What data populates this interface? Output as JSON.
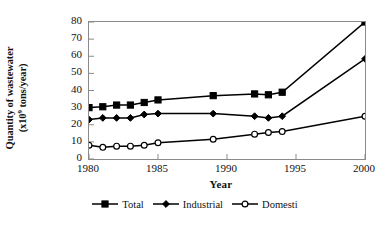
{
  "chart_data": {
    "type": "line",
    "title": "",
    "xlabel": "Year",
    "ylabel_line1": "Quantity of wastewater",
    "ylabel_line2_pre": "(x10",
    "ylabel_line2_sup": "9",
    "ylabel_line2_post": " tons/year)",
    "xlim": [
      1980,
      2000
    ],
    "ylim": [
      0,
      80
    ],
    "xticks": [
      1980,
      1985,
      1990,
      1995,
      2000
    ],
    "yticks": [
      0,
      10,
      20,
      30,
      40,
      50,
      60,
      70,
      80
    ],
    "grid": false,
    "legend_position": "bottom",
    "x": [
      1980,
      1981,
      1982,
      1983,
      1984,
      1985,
      1989,
      1992,
      1993,
      1994,
      2000
    ],
    "series": [
      {
        "name": "Total",
        "marker": "filled-square",
        "color": "#000000",
        "values": [
          30,
          30.5,
          31.5,
          31.5,
          33,
          34.5,
          37,
          38,
          37.5,
          39,
          80
        ]
      },
      {
        "name": "Industrial",
        "marker": "filled-diamond",
        "color": "#000000",
        "values": [
          23,
          24,
          24,
          24,
          26,
          26.5,
          26.5,
          25,
          24,
          25,
          58.5
        ]
      },
      {
        "name": "Domesti",
        "marker": "open-circle",
        "color": "#000000",
        "values": [
          8,
          6.8,
          7.5,
          7.5,
          8,
          9.5,
          11.5,
          14.5,
          15.5,
          16,
          25
        ]
      }
    ]
  }
}
